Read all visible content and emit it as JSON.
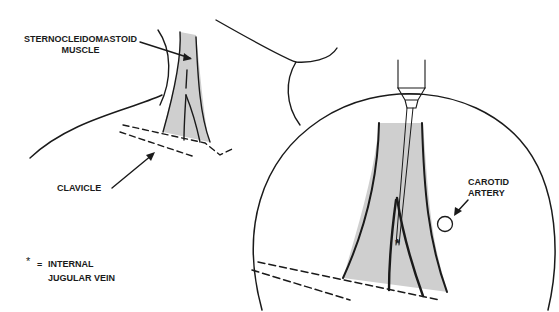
{
  "labels": {
    "scm_line1": "STERNOCLEIDOMASTOID",
    "scm_line2": "MUSCLE",
    "clavicle": "CLAVICLE",
    "carotid_line1": "CAROTID",
    "carotid_line2": "ARTERY",
    "legend_symbol": "*",
    "legend_equals": "=",
    "legend_line1": "INTERNAL",
    "legend_line2": "JUGULAR VEIN",
    "vein_marker": "*"
  },
  "colors": {
    "ink": "#1a1a1a",
    "muscle_fill": "#cfcfcf",
    "background": "#ffffff"
  }
}
